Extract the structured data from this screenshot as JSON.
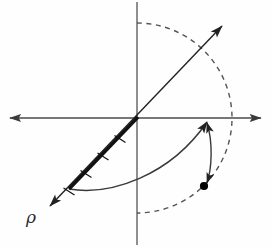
{
  "figure": {
    "background_color": "#fefefe",
    "width": 271,
    "height": 247,
    "labels": {
      "rho": "ρ"
    },
    "colors": {
      "axis": "#4a4a4a",
      "vector": "#222222",
      "thick_segment": "#111111",
      "arc_solid": "#3a3a3a",
      "arc_dashed": "#555555",
      "point": "#000000"
    },
    "geometry": {
      "origin": {
        "x": 137,
        "y": 118
      },
      "x_axis": {
        "x1": 6,
        "y1": 118,
        "x2": 265,
        "y2": 118,
        "arrows": "both"
      },
      "y_axis": {
        "x1": 137,
        "y1": 2,
        "x2": 137,
        "y2": 245,
        "arrows": "none"
      },
      "vector_line": {
        "tip": {
          "x": 226,
          "y": 22
        },
        "tail": {
          "x": 46,
          "y": 210
        },
        "arrows": "both"
      },
      "thick_segment": {
        "from": {
          "x": 137,
          "y": 118
        },
        "to": {
          "x": 69,
          "y": 189
        },
        "tick_count": 4
      },
      "ticks": [
        {
          "x": 120,
          "y": 136
        },
        {
          "x": 103,
          "y": 154
        },
        {
          "x": 86,
          "y": 171
        },
        {
          "x": 69,
          "y": 189
        }
      ],
      "radius_point": {
        "x": 209,
        "y": 118
      },
      "dashed_arc": {
        "start": {
          "x": 137,
          "y": 23
        },
        "end": {
          "x": 137,
          "y": 213
        },
        "through": {
          "x": 209,
          "y": 118
        },
        "style": "dashed"
      },
      "solid_arc": {
        "start": {
          "x": 69,
          "y": 189
        },
        "end": {
          "x": 209,
          "y": 118
        },
        "style": "solid",
        "arrow_at": "end"
      },
      "pointer_arc": {
        "start": {
          "x": 205,
          "y": 186
        },
        "end": {
          "x": 209,
          "y": 118
        },
        "style": "solid",
        "arrow_at": "both"
      },
      "marked_point": {
        "x": 204,
        "y": 186,
        "radius": 4
      }
    }
  }
}
